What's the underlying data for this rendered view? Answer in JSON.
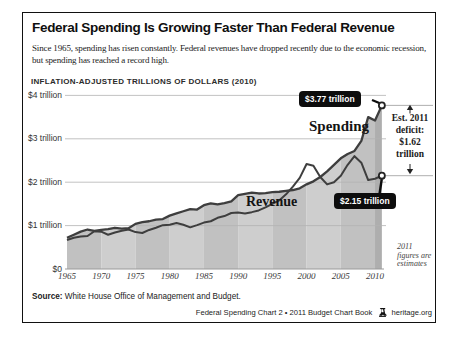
{
  "page": {
    "title": "Federal Spending Is Growing Faster Than Federal Revenue",
    "subtitle": "Since 1965, spending has risen constantly. Federal revenues have dropped recently due to the economic recession, but spending has reached a record high.",
    "source_label": "Source:",
    "source_text": " White House Office of Management and Budget.",
    "footer_text": "Federal Spending Chart 2 • 2011 Budget Chart Book",
    "footer_site": "heritage.org"
  },
  "chart_data": {
    "type": "area",
    "title": "Federal Spending Is Growing Faster Than Federal Revenue",
    "axis_unit_label": "INFLATION-ADJUSTED TRILLIONS OF DOLLARS (2010)",
    "xlabel": "",
    "ylabel": "Inflation-adjusted trillions of dollars (2010)",
    "ylim": [
      0,
      4
    ],
    "grid": "horizontal",
    "x": [
      1965,
      1966,
      1967,
      1968,
      1969,
      1970,
      1971,
      1972,
      1973,
      1974,
      1975,
      1976,
      1977,
      1978,
      1979,
      1980,
      1981,
      1982,
      1983,
      1984,
      1985,
      1986,
      1987,
      1988,
      1989,
      1990,
      1991,
      1992,
      1993,
      1994,
      1995,
      1996,
      1997,
      1998,
      1999,
      2000,
      2001,
      2002,
      2003,
      2004,
      2005,
      2006,
      2007,
      2008,
      2009,
      2010,
      2011
    ],
    "series": [
      {
        "name": "Spending",
        "values": [
          0.72,
          0.79,
          0.86,
          0.91,
          0.88,
          0.9,
          0.92,
          0.95,
          0.93,
          0.94,
          1.04,
          1.08,
          1.1,
          1.14,
          1.15,
          1.23,
          1.28,
          1.33,
          1.38,
          1.37,
          1.47,
          1.51,
          1.49,
          1.52,
          1.56,
          1.7,
          1.73,
          1.76,
          1.74,
          1.75,
          1.77,
          1.78,
          1.8,
          1.82,
          1.86,
          1.95,
          2.02,
          2.12,
          2.25,
          2.4,
          2.55,
          2.65,
          2.72,
          2.95,
          3.5,
          3.42,
          3.77
        ]
      },
      {
        "name": "Revenue",
        "values": [
          0.67,
          0.72,
          0.75,
          0.76,
          0.87,
          0.86,
          0.79,
          0.84,
          0.88,
          0.91,
          0.85,
          0.83,
          0.9,
          0.95,
          1.01,
          1.02,
          1.06,
          1.02,
          0.96,
          1.01,
          1.07,
          1.1,
          1.18,
          1.22,
          1.29,
          1.3,
          1.28,
          1.31,
          1.35,
          1.42,
          1.5,
          1.58,
          1.72,
          1.9,
          2.1,
          2.42,
          2.38,
          2.12,
          1.95,
          2.0,
          2.15,
          2.4,
          2.6,
          2.45,
          2.05,
          2.08,
          2.15
        ]
      }
    ],
    "ytick_values": [
      0,
      1,
      2,
      3,
      4
    ],
    "ytick_labels": [
      "$0",
      "$1 trillion",
      "$2 trillion",
      "$3 trillion",
      "$4 trillion"
    ],
    "xticks": [
      1965,
      1970,
      1975,
      1980,
      1985,
      1990,
      1995,
      2000,
      2005,
      2010
    ],
    "annotations": {
      "spending_label": "Spending",
      "revenue_label": "Revenue",
      "spending_callout": "$3.77 trillion",
      "revenue_callout": "$2.15 trillion",
      "spending_end_value": 3.77,
      "revenue_end_value": 2.15,
      "deficit_note_lines": [
        "Est. 2011",
        "deficit:",
        "$1.62",
        "trillion"
      ],
      "estimate_note_lines": [
        "2011",
        "figures are",
        "estimates"
      ]
    },
    "colors": {
      "band_dark": "#c1c1c1",
      "band_light": "#cecece",
      "band_final": "#aeaeae",
      "line": "#3e3e3e",
      "grid": "#b2b2b2",
      "axis": "#9a9a9a",
      "ref_line": "#999999",
      "callout_bg": "#0d0d0d",
      "callout_text": "#ffffff",
      "marker_fill": "#ffffff",
      "marker_stroke": "#222222"
    }
  }
}
